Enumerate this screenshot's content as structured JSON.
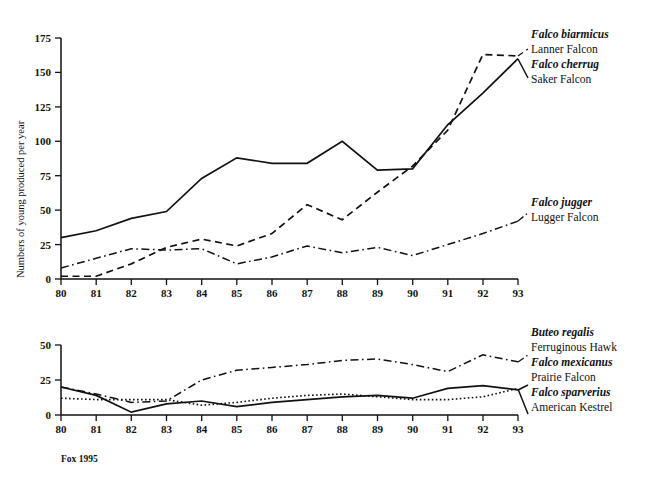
{
  "source_note": "Fox 1995",
  "chart_data": [
    {
      "type": "line",
      "title": "",
      "xlabel": "",
      "ylabel": "Numbers of young produced per year",
      "x": [
        80,
        81,
        82,
        83,
        84,
        85,
        86,
        87,
        88,
        89,
        90,
        91,
        92,
        93
      ],
      "xticklabels": [
        "80",
        "81",
        "82",
        "83",
        "84",
        "85",
        "86",
        "87",
        "88",
        "89",
        "90",
        "91",
        "92",
        "93"
      ],
      "yticklabels": [
        "0",
        "25",
        "50",
        "75",
        "100",
        "125",
        "150",
        "175"
      ],
      "xlim": [
        80,
        93
      ],
      "ylim": [
        0,
        175
      ],
      "grid": false,
      "legend_position": "right",
      "series": [
        {
          "name": "Saker Falcon",
          "scientific_name": "Falco cherrug",
          "linestyle": "solid",
          "values": [
            30,
            35,
            44,
            49,
            73,
            88,
            84,
            84,
            100,
            79,
            80,
            112,
            135,
            160
          ]
        },
        {
          "name": "Lanner Falcon",
          "scientific_name": "Falco biarmicus",
          "linestyle": "dashed",
          "values": [
            2,
            2,
            11,
            23,
            29,
            24,
            33,
            54,
            43,
            63,
            82,
            108,
            163,
            162
          ]
        },
        {
          "name": "Lugger Falcon",
          "scientific_name": "Falco jugger",
          "linestyle": "dashdot",
          "values": [
            8,
            15,
            22,
            21,
            22,
            11,
            16,
            24,
            19,
            23,
            17,
            25,
            33,
            42
          ]
        }
      ]
    },
    {
      "type": "line",
      "title": "",
      "xlabel": "",
      "ylabel": "",
      "x": [
        80,
        81,
        82,
        83,
        84,
        85,
        86,
        87,
        88,
        89,
        90,
        91,
        92,
        93
      ],
      "xticklabels": [
        "80",
        "81",
        "82",
        "83",
        "84",
        "85",
        "86",
        "87",
        "88",
        "89",
        "90",
        "91",
        "92",
        "93"
      ],
      "yticklabels": [
        "0",
        "25",
        "50"
      ],
      "xlim": [
        80,
        93
      ],
      "ylim": [
        0,
        50
      ],
      "grid": false,
      "legend_position": "right",
      "series": [
        {
          "name": "Ferruginous Hawk",
          "scientific_name": "Buteo regalis",
          "linestyle": "dashdot",
          "values": [
            20,
            15,
            9,
            10,
            25,
            32,
            34,
            36,
            39,
            40,
            36,
            31,
            43,
            38
          ]
        },
        {
          "name": "Prairie Falcon",
          "scientific_name": "Falco mexicanus",
          "linestyle": "solid",
          "values": [
            20,
            14,
            2,
            8,
            10,
            6,
            9,
            11,
            13,
            14,
            12,
            19,
            21,
            18
          ]
        },
        {
          "name": "American Kestrel",
          "scientific_name": "Falco sparverius",
          "linestyle": "dotted",
          "values": [
            12,
            11,
            11,
            11,
            7,
            9,
            12,
            14,
            15,
            13,
            11,
            11,
            13,
            19
          ]
        }
      ]
    }
  ],
  "top_chart": {
    "ylabel": "Numbers of young produced per year",
    "yticks": [
      "175",
      "150",
      "125",
      "100",
      "75",
      "50",
      "25",
      "0"
    ],
    "xticks": [
      "80",
      "81",
      "82",
      "83",
      "84",
      "85",
      "86",
      "87",
      "88",
      "89",
      "90",
      "91",
      "92",
      "93"
    ],
    "legend": [
      {
        "sci": "Falco biarmicus",
        "com": "Lanner Falcon"
      },
      {
        "sci": "Falco cherrug",
        "com": "Saker Falcon"
      },
      {
        "sci": "Falco jugger",
        "com": "Lugger Falcon"
      }
    ]
  },
  "bottom_chart": {
    "yticks": [
      "50",
      "25",
      "0"
    ],
    "xticks": [
      "80",
      "81",
      "82",
      "83",
      "84",
      "85",
      "86",
      "87",
      "88",
      "89",
      "90",
      "91",
      "92",
      "93"
    ],
    "legend": [
      {
        "sci": "Buteo regalis",
        "com": "Ferruginous Hawk"
      },
      {
        "sci": "Falco mexicanus",
        "com": "Prairie Falcon"
      },
      {
        "sci": "Falco sparverius",
        "com": "American Kestrel"
      }
    ]
  }
}
